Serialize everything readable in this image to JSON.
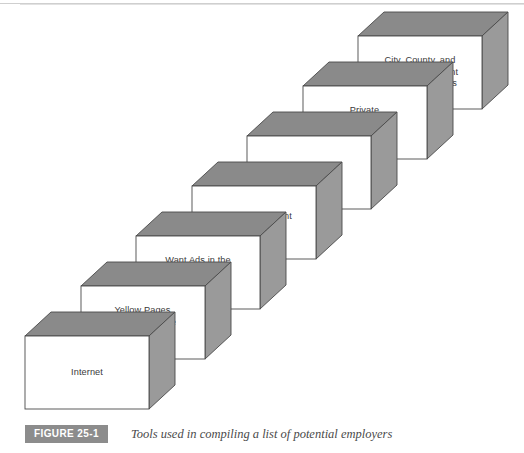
{
  "figure": {
    "badge": "FIGURE 25-1",
    "caption": "Tools used in compiling a list of potential employers"
  },
  "diagram": {
    "type": "staircase-3d",
    "colors": {
      "front_face": "#ffffff",
      "top_face": "#8a8a8a",
      "side_face": "#9a9a9a",
      "outline": "#4a4a4a",
      "text": "#3a3a3a",
      "badge_background": "#8c8c8c",
      "badge_text": "#ffffff",
      "caption_text": "#4a4a4a",
      "page_background": "#ffffff"
    },
    "steps": [
      {
        "index": 1,
        "label": "Internet"
      },
      {
        "index": 2,
        "label": "Yellow Pages\nof theTelephone\nDirectory"
      },
      {
        "index": 3,
        "label": "Want Ads in the\nSunday\nNewspaper"
      },
      {
        "index": 4,
        "label": "State Employment\nService"
      },
      {
        "index": 5,
        "label": "Local Chamber\nof Commerce"
      },
      {
        "index": 6,
        "label": "Private\nEmployment\nAgencies"
      },
      {
        "index": 7,
        "label": "City, County, and\nState Government\nPersonnel Offices"
      }
    ]
  }
}
